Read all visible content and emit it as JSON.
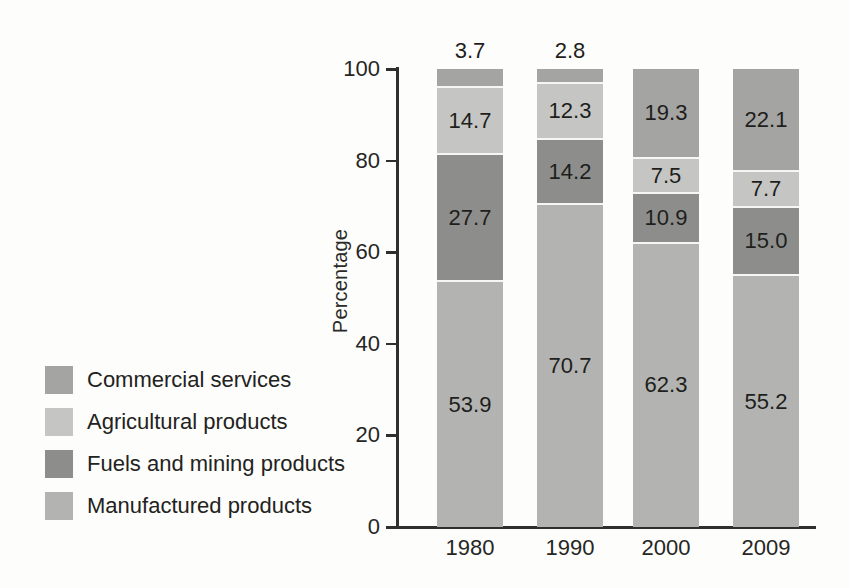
{
  "chart_data": {
    "type": "bar",
    "stacked": true,
    "title": "",
    "xlabel": "",
    "ylabel": "Percentage",
    "ylim": [
      0,
      100
    ],
    "yticks": [
      0,
      20,
      40,
      60,
      80,
      100
    ],
    "grid": false,
    "legend_position": "bottom-left",
    "categories": [
      "1980",
      "1990",
      "2000",
      "2009"
    ],
    "series": [
      {
        "name": "Manufactured products",
        "color": "#b3b4b1",
        "values": [
          53.9,
          70.7,
          62.3,
          55.2
        ]
      },
      {
        "name": "Fuels and mining products",
        "color": "#8d8e8b",
        "values": [
          27.7,
          14.2,
          10.9,
          15.0
        ]
      },
      {
        "name": "Agricultural products",
        "color": "#c5c6c3",
        "values": [
          14.7,
          12.3,
          7.5,
          7.7
        ]
      },
      {
        "name": "Commercial services",
        "color": "#a4a4a2",
        "values": [
          3.7,
          2.8,
          19.3,
          22.1
        ]
      }
    ],
    "stack_order_bottom_to_top": [
      "Manufactured products",
      "Fuels and mining products",
      "Agricultural products",
      "Commercial services"
    ],
    "legend_order": [
      "Commercial services",
      "Agricultural products",
      "Fuels and mining products",
      "Manufactured products"
    ],
    "value_label_decimals": 1,
    "outside_label_threshold": 6
  },
  "style_colors": {
    "axis": "#2f2f2d",
    "text": "#262624",
    "segment_separator": "#f6f6f3",
    "paper": "#fdfdfb"
  }
}
